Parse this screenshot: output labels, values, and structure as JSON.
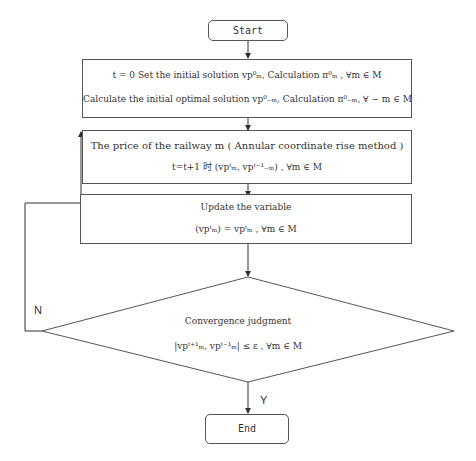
{
  "start": {
    "label": "Start"
  },
  "init": {
    "line1": "t = 0 Set the initial solution vp⁰ₘ, Calculation π⁰ₘ , ∀m ∈ M",
    "line2": "Calculate the initial optimal solution vp⁰₋ₘ, Calculation π⁰₋ₘ, ∀ − m ∈ M"
  },
  "price": {
    "line1": "The price of the railway m ( Annular coordinate rise method )",
    "line2": "t=t+1 时 (vpᵗₘ, vpᵗ⁻¹₋ₘ) , ∀m ∈ M"
  },
  "update": {
    "line1": "Update the variable",
    "line2": "(vpᵗₘ) = vpᵗₘ , ∀m ∈ M"
  },
  "decision": {
    "line1": "Convergence judgment",
    "line2": "|vpᵗ⁺¹ₘ, vpᵗ⁻¹ₘ| ≤ ε , ∀m ∈ M"
  },
  "labels": {
    "no": "N",
    "yes": "Y"
  },
  "end": {
    "label": "End"
  }
}
